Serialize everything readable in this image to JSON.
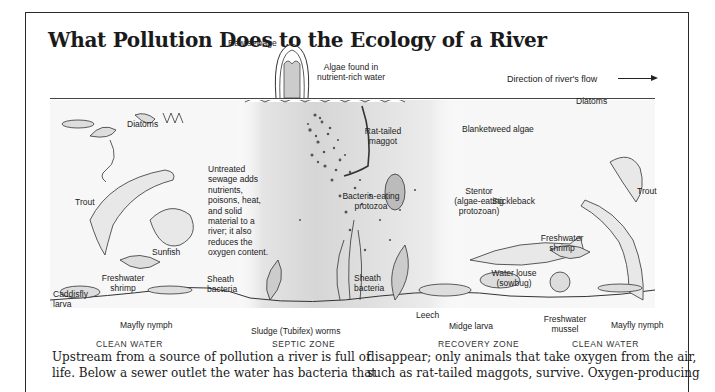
{
  "title": "What Pollution Does to the Ecology of a River",
  "diagram": {
    "flow_label": "Direction of river's flow",
    "labels": {
      "raw_sewage": "Raw sewage",
      "algae_nutrient_line1": "Algae found in",
      "algae_nutrient_line2": "nutrient-rich water",
      "diatoms_left": "Diatoms",
      "diatoms_right": "Diatoms",
      "rat_tailed_line1": "Rat-tailed",
      "rat_tailed_line2": "maggot",
      "blanketweed": "Blanketweed algae",
      "trout_left": "Trout",
      "trout_right": "Trout",
      "sunfish": "Sunfish",
      "untreated_lines": [
        "Untreated",
        "sewage adds",
        "nutrients,",
        "poisons, heat,",
        "and solid",
        "material to a",
        "river; it also",
        "reduces the",
        "oxygen content."
      ],
      "bacteria_eating_line1": "Bacteria-eating",
      "bacteria_eating_line2": "protozoa",
      "stentor_line1": "Stentor",
      "stentor_line2": "(algae-eating",
      "stentor_line3": "protozoan)",
      "stickleback": "Stickleback",
      "fw_shrimp_left_line1": "Freshwater",
      "fw_shrimp_left_line2": "shrimp",
      "fw_shrimp_right_line1": "Freshwater",
      "fw_shrimp_right_line2": "shrimp",
      "caddisfly_line1": "Caddisfly",
      "caddisfly_line2": "larva",
      "sheath_left_line1": "Sheath",
      "sheath_left_line2": "bacteria",
      "sheath_right_line1": "Sheath",
      "sheath_right_line2": "bacteria",
      "water_louse_line1": "Water louse",
      "water_louse_line2": "(sowbug)",
      "mayfly_left": "Mayfly nymph",
      "mayfly_right": "Mayfly nymph",
      "sludge_worms": "Sludge (Tubifex) worms",
      "leech": "Leech",
      "midge_larva": "Midge larva",
      "fw_mussel_line1": "Freshwater",
      "fw_mussel_line2": "mussel"
    },
    "zones": [
      "CLEAN WATER",
      "SEPTIC ZONE",
      "RECOVERY ZONE",
      "CLEAN WATER"
    ]
  },
  "body": {
    "left_col": [
      "Upstream from a source of pollution a river is full of",
      "life. Below a sewer outlet the water has bacteria that"
    ],
    "right_col": [
      "disappear; only animals that take oxygen from the air,",
      "such as rat-tailed maggots, survive. Oxygen-producing"
    ]
  },
  "colors": {
    "ink": "#1a1a1a",
    "water_tint": "#e9e9e9",
    "septic_dark": "#bdbdbd"
  }
}
